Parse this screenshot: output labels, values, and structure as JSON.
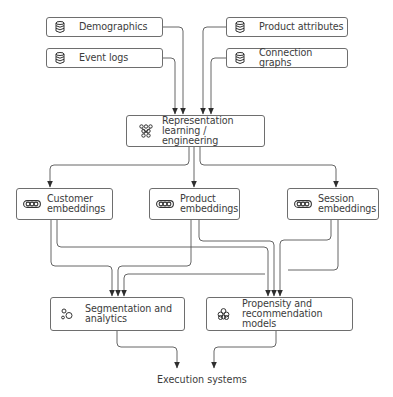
{
  "diagram": {
    "sources": [
      {
        "id": "demographics",
        "label": "Demographics",
        "icon": "database-icon"
      },
      {
        "id": "event-logs",
        "label": "Event logs",
        "icon": "database-icon"
      },
      {
        "id": "product-attributes",
        "label": "Product attributes",
        "icon": "database-icon"
      },
      {
        "id": "connection-graphs",
        "label": "Connection graphs",
        "icon": "database-icon"
      }
    ],
    "core": {
      "id": "representation",
      "label": "Representation\nlearning / engineering",
      "icon": "network-icon"
    },
    "embeddings": [
      {
        "id": "customer-embeddings",
        "label": "Customer\nembeddings",
        "icon": "embedding-vector-icon"
      },
      {
        "id": "product-embeddings",
        "label": "Product\nembeddings",
        "icon": "embedding-vector-icon"
      },
      {
        "id": "session-embeddings",
        "label": "Session\nembeddings",
        "icon": "embedding-vector-icon"
      }
    ],
    "consumers": [
      {
        "id": "segmentation",
        "label": "Segmentation and\nanalytics",
        "icon": "clusters-icon"
      },
      {
        "id": "propensity",
        "label": "Propensity and\nrecommendation models",
        "icon": "model-stack-icon"
      }
    ],
    "terminal": {
      "label": "Execution systems"
    },
    "colors": {
      "line": "#4a4a4a",
      "border": "#6e6e6e",
      "text": "#3c3c3c"
    }
  }
}
